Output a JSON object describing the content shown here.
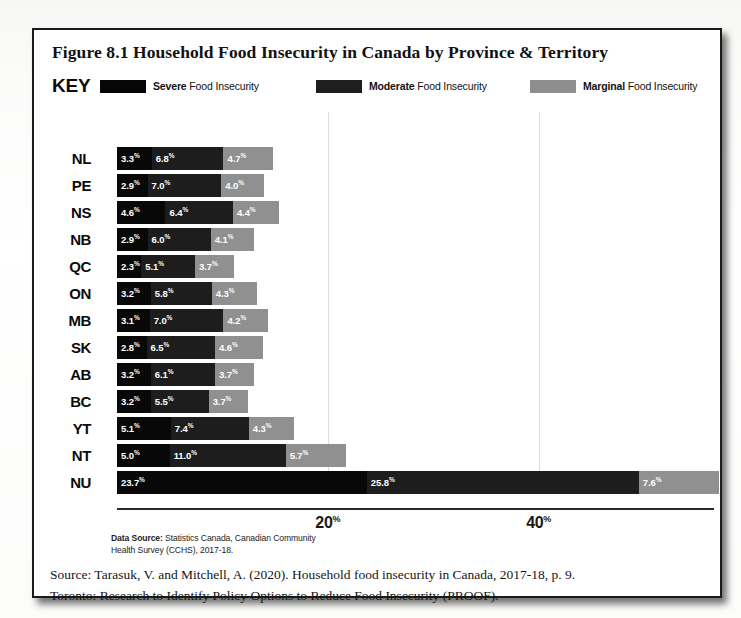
{
  "figure": {
    "title": "Figure 8.1 Household Food Insecurity in Canada by Province & Territory",
    "key_word": "KEY",
    "legend": [
      {
        "id": "severe",
        "bold": "Severe",
        "rest": "Food Insecurity",
        "color": "#080808",
        "swatch_name": "legend-swatch-severe"
      },
      {
        "id": "moderate",
        "bold": "Moderate",
        "rest": "Food Insecurity",
        "color": "#1d1d1d",
        "swatch_name": "legend-swatch-moderate"
      },
      {
        "id": "marginal",
        "bold": "Marginal",
        "rest": "Food Insecurity",
        "color": "#909090",
        "swatch_name": "legend-swatch-marginal"
      }
    ],
    "data_source_bold": "Data Source:",
    "data_source_text": " Statistics Canada, Canadian Community Health Survey (CCHS), 2017-18.",
    "citation_line1": "Source: Tarasuk, V. and Mitchell, A. (2020). Household food insecurity in Canada, 2017-18, p. 9.",
    "citation_line2": "Toronto: Research to Identify Policy Options to Reduce Food Insecurity (PROOF)."
  },
  "chart_data": {
    "type": "bar",
    "orientation": "horizontal",
    "stacked": true,
    "title": "Figure 8.1 Household Food Insecurity in Canada by Province & Territory",
    "xlabel": "",
    "ylabel": "",
    "xlim": [
      0,
      60
    ],
    "xticks": [
      20,
      40
    ],
    "xtick_labels": [
      "20%",
      "40%"
    ],
    "grid": "vertical-at-ticks",
    "legend_position": "top",
    "value_suffix": "%",
    "categories": [
      "NL",
      "PE",
      "NS",
      "NB",
      "QC",
      "ON",
      "MB",
      "SK",
      "AB",
      "BC",
      "YT",
      "NT",
      "NU"
    ],
    "series": [
      {
        "name": "Severe Food Insecurity",
        "color": "#080808",
        "values": [
          3.3,
          2.9,
          4.6,
          2.9,
          2.3,
          3.2,
          3.1,
          2.8,
          3.2,
          3.2,
          5.1,
          5.0,
          23.7
        ]
      },
      {
        "name": "Moderate Food Insecurity",
        "color": "#1d1d1d",
        "values": [
          6.8,
          7.0,
          6.4,
          6.0,
          5.1,
          5.8,
          7.0,
          6.5,
          6.1,
          5.5,
          7.4,
          11.0,
          25.8
        ]
      },
      {
        "name": "Marginal Food Insecurity",
        "color": "#909090",
        "values": [
          4.7,
          4.0,
          4.4,
          4.1,
          3.7,
          4.3,
          4.2,
          4.6,
          3.7,
          3.7,
          4.3,
          5.7,
          7.6
        ]
      }
    ],
    "totals": [
      14.8,
      13.9,
      15.4,
      13.0,
      11.1,
      13.3,
      14.3,
      13.9,
      13.0,
      12.4,
      16.8,
      21.7,
      57.1
    ]
  }
}
